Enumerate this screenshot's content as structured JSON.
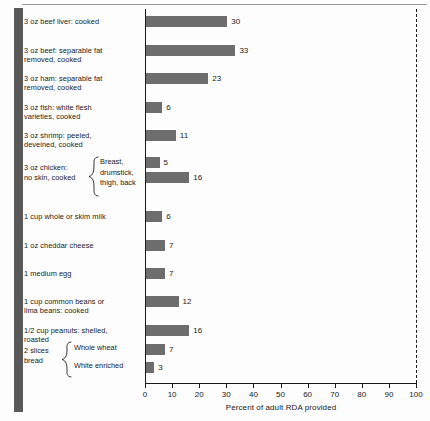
{
  "chart_data": {
    "type": "bar",
    "orientation": "horizontal",
    "title": "",
    "xlabel": "Percent of adult RDA provided",
    "ylabel": "",
    "xlim": [
      0,
      100
    ],
    "xticks": [
      0,
      10,
      20,
      30,
      40,
      50,
      60,
      70,
      80,
      90,
      100
    ],
    "grid": false,
    "legend": null,
    "reference_line": {
      "value": 100,
      "style": "dashed"
    },
    "categories": [
      "3 oz beef liver:  cooked",
      "3 oz beef:  separable fat\nremoved, cooked",
      "3 oz ham:  separable fat\nremoved, cooked",
      "3 oz fish:  white flesh\nvarieties, cooked",
      "3 oz shrimp:  peeled,\ndeveined, cooked",
      "3 oz chicken: no skin, cooked — Breast,",
      "3 oz chicken: no skin, cooked — drumstick, thigh, back",
      "1 cup whole or skim milk",
      "1 oz cheddar cheese",
      "1 medium egg",
      "1 cup common beans or\nlima beans:  cooked",
      "1/2 cup peanuts:  shelled,\nroasted",
      "2 slices bread — Whole wheat",
      "2 slices bread — White enriched"
    ],
    "values": [
      30,
      33,
      23,
      6,
      11,
      5,
      16,
      6,
      7,
      7,
      12,
      16,
      7,
      3
    ],
    "bar_color": "#6d6d6d"
  },
  "axis": {
    "xlabel": "Percent of adult RDA provided",
    "ticks": [
      "0",
      "10",
      "20",
      "30",
      "40",
      "50",
      "60",
      "70",
      "80",
      "90",
      "100"
    ]
  },
  "rows": [
    {
      "label": "3 oz beef liver:  cooked",
      "value": 30,
      "value_text": "30"
    },
    {
      "label": "3 oz beef:  separable fat\nremoved, cooked",
      "value": 33,
      "value_text": "33"
    },
    {
      "label": "3 oz ham:  separable fat\nremoved, cooked",
      "value": 23,
      "value_text": "23"
    },
    {
      "label": "3 oz fish:  white flesh\nvarieties, cooked",
      "value": 6,
      "value_text": "6"
    },
    {
      "label": "3 oz shrimp:  peeled,\ndeveined, cooked",
      "value": 11,
      "value_text": "11"
    },
    {
      "label": "1 cup whole or skim milk",
      "value": 6,
      "value_text": "6"
    },
    {
      "label": "1 oz cheddar cheese",
      "value": 7,
      "value_text": "7"
    },
    {
      "label": "1 medium egg",
      "value": 7,
      "value_text": "7"
    },
    {
      "label": "1 cup common beans or\nlima beans:  cooked",
      "value": 12,
      "value_text": "12"
    },
    {
      "label": "1/2 cup peanuts:  shelled,\nroasted",
      "value": 16,
      "value_text": "16"
    }
  ],
  "chicken_group": {
    "outer_label": "3 oz chicken:\nno skin, cooked",
    "sub_label_1": "Breast,",
    "sub_label_2": "drumstick,\nthigh, back",
    "value_1": 5,
    "value_text_1": "5",
    "value_2": 16,
    "value_text_2": "16"
  },
  "bread_group": {
    "outer_label": "2 slices\nbread",
    "sub_label_1": "Whole wheat",
    "sub_label_2": "White enriched",
    "value_1": 7,
    "value_text_1": "7",
    "value_2": 3,
    "value_text_2": "3"
  },
  "colors": {
    "bar": "#6d6d6d",
    "axis": "#1a1a1a",
    "gutter": "#595959",
    "background": "#fdfdfd"
  }
}
